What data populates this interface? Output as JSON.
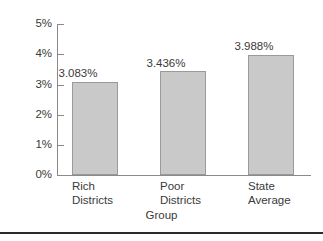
{
  "chart_data": {
    "type": "bar",
    "title": "",
    "subtitle": "",
    "xlabel": "Group",
    "ylabel": "",
    "categories": [
      "Rich Districts",
      "Poor Districts",
      "State Average"
    ],
    "category_lines": [
      [
        "Rich",
        "Districts"
      ],
      [
        "Poor",
        "Districts"
      ],
      [
        "State",
        "Average"
      ]
    ],
    "values": [
      3.083,
      3.436,
      3.988
    ],
    "value_labels": [
      "3.083%",
      "3.436%",
      "3.988%"
    ],
    "ylim": [
      0,
      5
    ],
    "ytick_values": [
      0,
      1,
      2,
      3,
      4,
      5
    ],
    "ytick_labels": [
      "0%",
      "1%",
      "2%",
      "3%",
      "4%",
      "5%"
    ],
    "grid": false,
    "legend": false,
    "legend_position": "none",
    "bar_fill_color": "#c9c9c9",
    "bar_border_color": "#9a9a9a",
    "axis_color": "#8a8a8a",
    "text_color": "#3a3a3a",
    "background_color": "#ffffff",
    "rule_color": "#2b2b2b"
  }
}
